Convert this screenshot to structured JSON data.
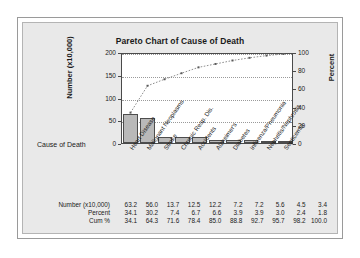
{
  "chart_data": {
    "type": "bar",
    "title": "Pareto Chart of Cause of Death",
    "xlabel": "Cause of Death",
    "ylabel": "Number (x10,000)",
    "y2label": "Percent",
    "ylim": [
      0,
      200
    ],
    "y2lim": [
      0,
      100
    ],
    "yticks": [
      "0",
      "50",
      "100",
      "150",
      "200"
    ],
    "y2ticks": [
      "0",
      "20",
      "40",
      "60",
      "80",
      "100"
    ],
    "grid": true,
    "legend": "none",
    "categories": [
      "Heart Disease",
      "Malignant Neoplasms",
      "Stroke",
      "Chronic Resp. Dis.",
      "Accidents",
      "Alzheimer's",
      "Diabetes",
      "Influenza/Pneumonia",
      "Nephritis/Nephrosis",
      "Septicemia"
    ],
    "values": [
      63.2,
      56.0,
      13.7,
      12.5,
      12.2,
      7.2,
      7.2,
      5.6,
      4.5,
      3.4
    ],
    "series": [
      {
        "name": "Number (x10,000)",
        "type": "bar",
        "values": [
          63.2,
          56.0,
          13.7,
          12.5,
          12.2,
          7.2,
          7.2,
          5.6,
          4.5,
          3.4
        ]
      },
      {
        "name": "Cum %",
        "type": "line",
        "axis": "right",
        "values": [
          34.1,
          64.3,
          71.6,
          78.4,
          85.0,
          88.8,
          92.7,
          95.7,
          98.2,
          100.0
        ]
      }
    ],
    "bar_color": "#b9b9b9",
    "line_color": "#5a5a5a"
  },
  "table": {
    "rows": [
      {
        "label": "Number (x10,000)",
        "values": [
          "63.2",
          "56.0",
          "13.7",
          "12.5",
          "12.2",
          "7.2",
          "7.2",
          "5.6",
          "4.5",
          "3.4"
        ]
      },
      {
        "label": "Percent",
        "values": [
          "34.1",
          "30.2",
          "7.4",
          "6.7",
          "6.6",
          "3.9",
          "3.9",
          "3.0",
          "2.4",
          "1.8"
        ]
      },
      {
        "label": "Cum %",
        "values": [
          "34.1",
          "64.3",
          "71.6",
          "78.4",
          "85.0",
          "88.8",
          "92.7",
          "95.7",
          "98.2",
          "100.0"
        ]
      }
    ]
  }
}
